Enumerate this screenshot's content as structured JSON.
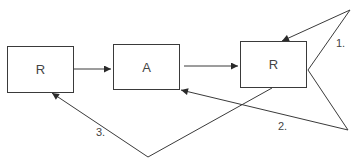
{
  "nodes": [
    {
      "id": "r1",
      "label": "R",
      "x": 7,
      "y": 46,
      "w": 67,
      "h": 47
    },
    {
      "id": "a",
      "label": "A",
      "x": 113,
      "y": 44,
      "w": 67,
      "h": 46
    },
    {
      "id": "r2",
      "label": "R",
      "x": 240,
      "y": 41,
      "w": 67,
      "h": 47
    }
  ],
  "edge_labels": {
    "one": "1.",
    "two": "2.",
    "three": "3."
  },
  "colors": {
    "stroke": "#3a3a3a",
    "text": "#444444"
  }
}
